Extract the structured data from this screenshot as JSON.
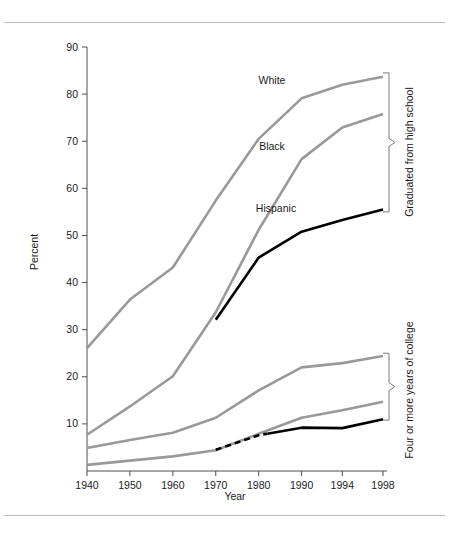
{
  "figure": {
    "background": "#ffffff",
    "top_rule": true,
    "bottom_rule": true
  },
  "axes": {
    "ylabel": "Percent",
    "xlabel": "Year",
    "y_ticks": [
      10,
      20,
      30,
      40,
      50,
      60,
      70,
      80,
      90
    ],
    "x_ticks": [
      "1940",
      "1950",
      "1960",
      "1970",
      "1980",
      "1990",
      "1994",
      "1998"
    ]
  },
  "annotations": {
    "series_white": "White",
    "series_black": "Black",
    "series_hispanic": "Hispanic",
    "group_highschool": "Graduated from high school",
    "group_college": "Four or more years of college"
  },
  "colors": {
    "gray_line": "#999999",
    "black_line": "#000000",
    "axis": "#4d4d4d",
    "brace": "#7a7a7a",
    "rule": "#b9bcc0",
    "text": "#1a1a1a"
  },
  "chart_data": {
    "type": "line",
    "title": "",
    "xlabel": "Year",
    "ylabel": "Percent",
    "ylim": [
      0,
      90
    ],
    "grid": false,
    "legend": "inline-labels",
    "x": [
      "1940",
      "1950",
      "1960",
      "1970",
      "1980",
      "1990",
      "1994",
      "1998"
    ],
    "x_positions_note": "unequal spacing: 1940-1990 decadal, then 1994 and 1998",
    "series": [
      {
        "name": "White",
        "group": "Graduated from high school",
        "color": "#999999",
        "style": "solid",
        "x": [
          "1940",
          "1950",
          "1960",
          "1970",
          "1980",
          "1990",
          "1994",
          "1998"
        ],
        "values": [
          26.1,
          36.4,
          43.2,
          57.4,
          70.5,
          79.1,
          82.0,
          83.7
        ]
      },
      {
        "name": "Black",
        "group": "Graduated from high school",
        "color": "#999999",
        "style": "solid",
        "x": [
          "1940",
          "1950",
          "1960",
          "1970",
          "1980",
          "1990",
          "1994",
          "1998"
        ],
        "values": [
          7.7,
          13.7,
          20.1,
          33.7,
          51.2,
          66.2,
          72.9,
          75.8
        ]
      },
      {
        "name": "Hispanic",
        "group": "Graduated from high school",
        "color": "#000000",
        "style": "solid",
        "x": [
          "1970",
          "1980",
          "1990",
          "1994",
          "1998"
        ],
        "values": [
          32.1,
          45.3,
          50.8,
          53.3,
          55.5
        ]
      },
      {
        "name": "White",
        "group": "Four or more years of college",
        "color": "#999999",
        "style": "solid",
        "x": [
          "1940",
          "1950",
          "1960",
          "1970",
          "1980",
          "1990",
          "1994",
          "1998"
        ],
        "values": [
          4.9,
          6.6,
          8.1,
          11.3,
          17.1,
          22.0,
          22.9,
          24.4
        ]
      },
      {
        "name": "Black",
        "group": "Four or more years of college",
        "color": "#999999",
        "style": "solid",
        "x": [
          "1940",
          "1950",
          "1960",
          "1970",
          "1980",
          "1990",
          "1994",
          "1998"
        ],
        "values": [
          1.3,
          2.2,
          3.1,
          4.4,
          7.9,
          11.3,
          12.9,
          14.7
        ]
      },
      {
        "name": "Hispanic",
        "group": "Four or more years of college",
        "color": "#000000",
        "style": "dashed-then-solid",
        "dashed_until": "1982",
        "x": [
          "1970",
          "1980",
          "1990",
          "1994",
          "1998"
        ],
        "values": [
          4.5,
          7.6,
          9.2,
          9.1,
          11.0
        ]
      }
    ]
  }
}
